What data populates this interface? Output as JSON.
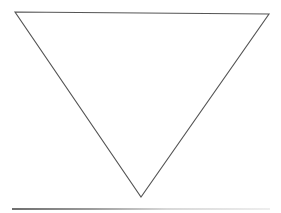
{
  "diagram": {
    "shape": "inverted-triangle",
    "stroke_color": "#555555",
    "fill_color": "#ffffff",
    "background_color": "#ffffff",
    "vertices": {
      "top_left": [
        15,
        12
      ],
      "top_right": [
        269,
        14
      ],
      "bottom": [
        141,
        197
      ]
    }
  },
  "bottom_rule": {
    "color_start": "#6e6e6e",
    "color_end": "#eeeeee"
  }
}
